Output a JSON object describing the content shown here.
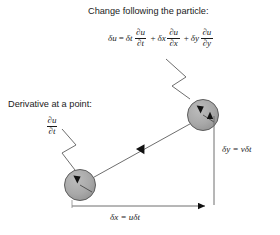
{
  "figure": {
    "background": "#ffffff",
    "ink": "#1a1a1a",
    "line_color": "#6e6e6e",
    "sphere_fill": "#a8a8a8",
    "sphere_stroke": "#555555",
    "arrow_fill": "#111111"
  },
  "labels": {
    "change_following_particle": "Change following the particle:",
    "derivative_at_a_point": "Derivative at a point:"
  },
  "equation_main": {
    "lhs": "δu",
    "equals": "=",
    "terms": [
      {
        "coefficient": "δt",
        "numerator": "∂u",
        "denominator": "∂t",
        "sign": ""
      },
      {
        "coefficient": "δx",
        "numerator": "∂u",
        "denominator": "∂x",
        "sign": "+"
      },
      {
        "coefficient": "δy",
        "numerator": "∂u",
        "denominator": "∂y",
        "sign": "+"
      }
    ],
    "plain_text": "δu = δt ∂u/∂t + δx ∂u/∂x + δy ∂u/∂y"
  },
  "derivative_fraction": {
    "numerator": "∂u",
    "denominator": "∂t",
    "plain_text": "∂u/∂t"
  },
  "axis_labels": {
    "horizontal": "δx = uδt",
    "vertical": "δy = vδt"
  },
  "particles": [
    {
      "name": "start-particle",
      "cx": 80,
      "cy": 185,
      "r": 16
    },
    {
      "name": "end-particle",
      "cx": 203,
      "cy": 115,
      "r": 16
    }
  ],
  "displacement_arrow": {
    "from_x": 88,
    "from_y": 180,
    "to_x": 196,
    "to_y": 120,
    "arrowhead_at": "midpoint"
  }
}
